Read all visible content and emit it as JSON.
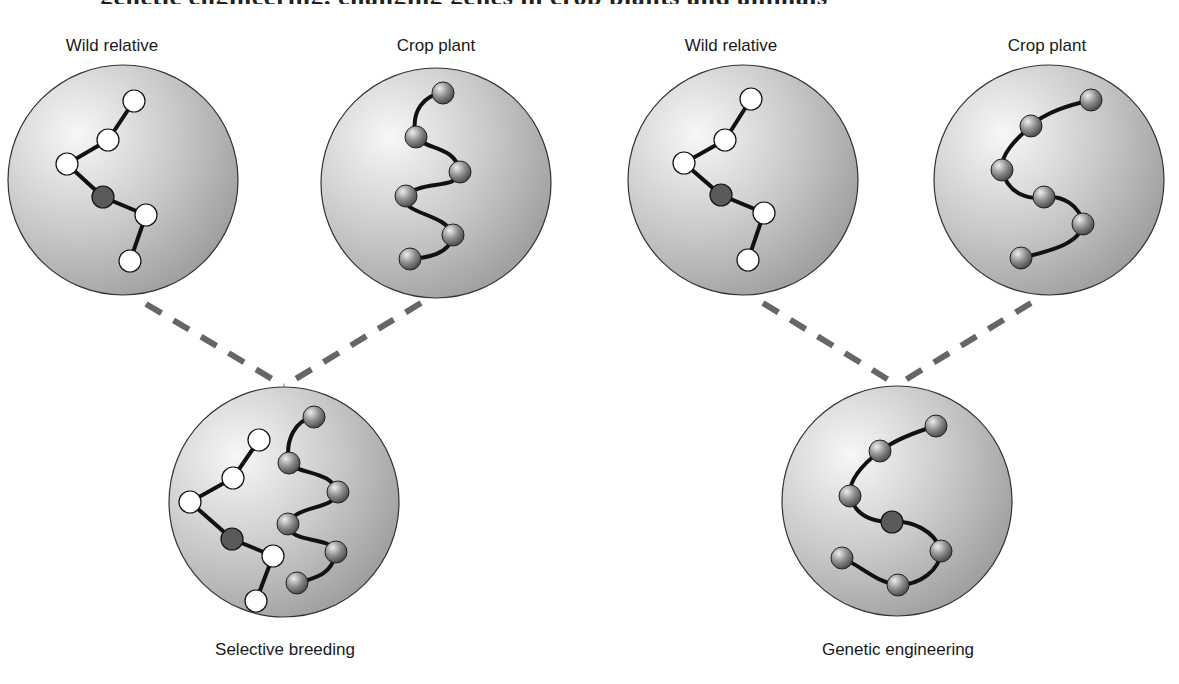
{
  "caption_partial": "Figure: Selective breeding vs. genetic engineering, showing gene transfer between a wild relative and a crop plant",
  "labels": {
    "wild_left": "Wild relative",
    "crop_left": "Crop plant",
    "wild_right": "Wild relative",
    "crop_right": "Crop plant",
    "result_left": "Selective breeding",
    "result_right": "Genetic engineering"
  },
  "colors": {
    "cell_light": "#f4f4f4",
    "cell_dark": "#9a9a9a",
    "white_gene": "#ffffff",
    "target_gene": "#5a5a5a",
    "crop_gene_light": "#d8d8d8",
    "crop_gene_dark": "#555555",
    "dash_line": "#666666",
    "chain_line": "#111111"
  },
  "diagram": {
    "cells": [
      {
        "id": "wild-left",
        "cx": 123,
        "cy": 180,
        "r": 115
      },
      {
        "id": "crop-left",
        "cx": 436,
        "cy": 183,
        "r": 115
      },
      {
        "id": "wild-right",
        "cx": 743,
        "cy": 180,
        "r": 115
      },
      {
        "id": "crop-right",
        "cx": 1049,
        "cy": 180,
        "r": 115
      },
      {
        "id": "selective-breeding",
        "cx": 284,
        "cy": 502,
        "r": 115
      },
      {
        "id": "genetic-engineering",
        "cx": 897,
        "cy": 501,
        "r": 115
      }
    ],
    "connections": [
      {
        "from": "wild-left",
        "to": "selective-breeding"
      },
      {
        "from": "crop-left",
        "to": "selective-breeding"
      },
      {
        "from": "wild-right",
        "to": "genetic-engineering"
      },
      {
        "from": "crop-right",
        "to": "genetic-engineering"
      }
    ],
    "legend_semantics": {
      "white_nodes": "wild relative genes",
      "dark_node": "desired gene from wild relative",
      "shaded_spheres": "crop plant genes"
    }
  }
}
